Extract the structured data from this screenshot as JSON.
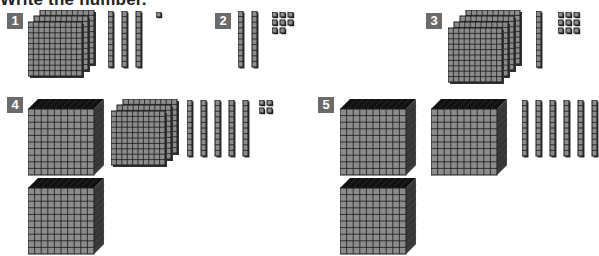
{
  "title": "Write the number.",
  "colors": {
    "badge": "#6b6b6b",
    "block_face": "#8c8c8c",
    "block_line": "#1a1a1a",
    "block_top": "#111111"
  },
  "problems": [
    {
      "label": "1",
      "thousands": 0,
      "hundreds": 3,
      "tens": 3,
      "ones": 1
    },
    {
      "label": "2",
      "thousands": 0,
      "hundreds": 0,
      "tens": 2,
      "ones": 8
    },
    {
      "label": "3",
      "thousands": 0,
      "hundreds": 4,
      "tens": 1,
      "ones": 9
    },
    {
      "label": "4",
      "thousands": 2,
      "hundreds": 3,
      "tens": 5,
      "ones": 4
    },
    {
      "label": "5",
      "thousands": 3,
      "hundreds": 0,
      "tens": 6,
      "ones": 0
    }
  ]
}
